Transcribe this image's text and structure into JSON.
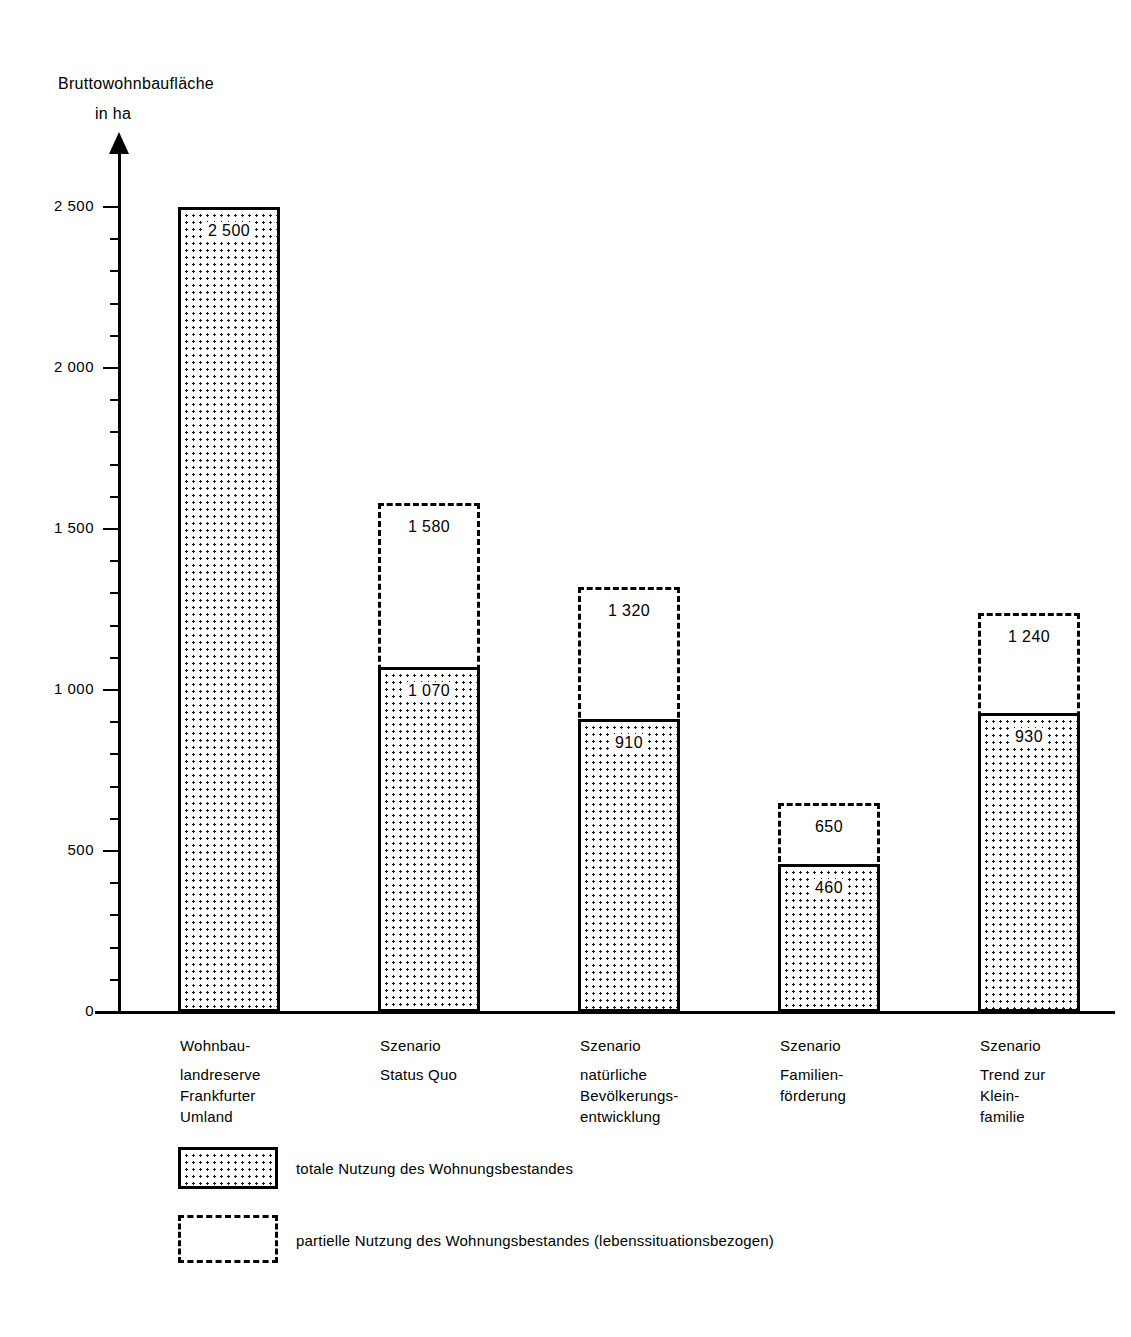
{
  "axis_title": {
    "line1": "Bruttowohnbaufläche",
    "line2": "in ha"
  },
  "chart_data": {
    "type": "bar",
    "title": "Bruttowohnbaufläche in ha",
    "xlabel": "",
    "ylabel": "Bruttowohnbaufläche in ha",
    "ylim": [
      0,
      2600
    ],
    "grid": false,
    "legend_position": "below-plot",
    "y_ticks_major": [
      0,
      500,
      1000,
      1500,
      2000,
      2500
    ],
    "y_tick_labels": [
      "0",
      "500",
      "1 000",
      "1 500",
      "2 000",
      "2 500"
    ],
    "y_tick_minor_step": 100,
    "categories": [
      "Wohnbaulandreserve Frankfurter Umland",
      "Szenario Status Quo",
      "Szenario natürliche Bevölkerungsentwicklung",
      "Szenario Familienförderung",
      "Szenario Trend zur Kleinfamilie"
    ],
    "category_labels": [
      {
        "head": "Wohnbau-",
        "body": "landreserve\nFrankfurter\nUmland"
      },
      {
        "head": "Szenario",
        "body": "Status Quo"
      },
      {
        "head": "Szenario",
        "body": "natürliche\nBevölkerungs-\nentwicklung"
      },
      {
        "head": "Szenario",
        "body": "Familien-\nförderung"
      },
      {
        "head": "Szenario",
        "body": "Trend zur\nKlein-\nfamilie"
      }
    ],
    "series": [
      {
        "name": "partielle Nutzung des Wohnungsbestandes (lebenssituationsbezogen)",
        "style": "dashed-outline",
        "values": [
          2500,
          1580,
          1320,
          650,
          1240
        ],
        "value_labels": [
          "2 500",
          "1 580",
          "1 320",
          "650",
          "1 240"
        ]
      },
      {
        "name": "totale Nutzung des Wohnungsbestandes",
        "style": "dotted-fill",
        "values": [
          2500,
          1070,
          910,
          460,
          930
        ],
        "value_labels": [
          "2 500",
          "1 070",
          "910",
          "460",
          "930"
        ]
      }
    ]
  },
  "legend": [
    {
      "label": "totale Nutzung des Wohnungsbestandes",
      "swatch": "dotted-fill-swatch"
    },
    {
      "label": "partielle Nutzung des Wohnungsbestandes (lebenssituationsbezogen)",
      "swatch": "dashed-outline-swatch"
    }
  ],
  "colors": {
    "ink": "#000000",
    "background": "#ffffff"
  }
}
